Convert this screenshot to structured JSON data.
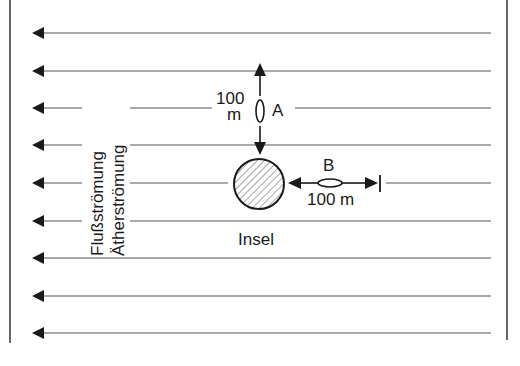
{
  "diagram": {
    "flow_labels": {
      "river": "Flußströmung",
      "ether": "Ätherströmung"
    },
    "island_label": "Insel",
    "swimmer_a": {
      "label": "A",
      "distance_value": "100",
      "distance_unit": "m"
    },
    "swimmer_b": {
      "label": "B",
      "distance": "100 m"
    },
    "flow_direction": "left",
    "flow_arrow_rows_y": [
      33,
      71,
      108,
      145,
      183,
      221,
      258,
      296,
      333
    ],
    "colors": {
      "ink": "#1a1a1a",
      "line": "#555555",
      "background": "#ffffff"
    }
  }
}
